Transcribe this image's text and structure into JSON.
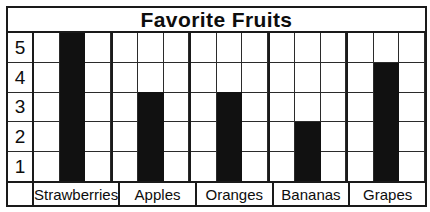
{
  "chart_data": {
    "type": "bar",
    "title": "Favorite Fruits",
    "xlabel": "",
    "ylabel": "",
    "categories": [
      "Strawberries",
      "Apples",
      "Oranges",
      "Bananas",
      "Grapes"
    ],
    "values": [
      5,
      3,
      3,
      2,
      4
    ],
    "ytick_labels": [
      "5",
      "4",
      "3",
      "2",
      "1"
    ],
    "ylim": [
      0,
      5
    ],
    "grid": true,
    "legend": "none",
    "bar_color": "#111111",
    "grid_color": "#2b2b2b",
    "border_color": "#1a1a1a"
  }
}
